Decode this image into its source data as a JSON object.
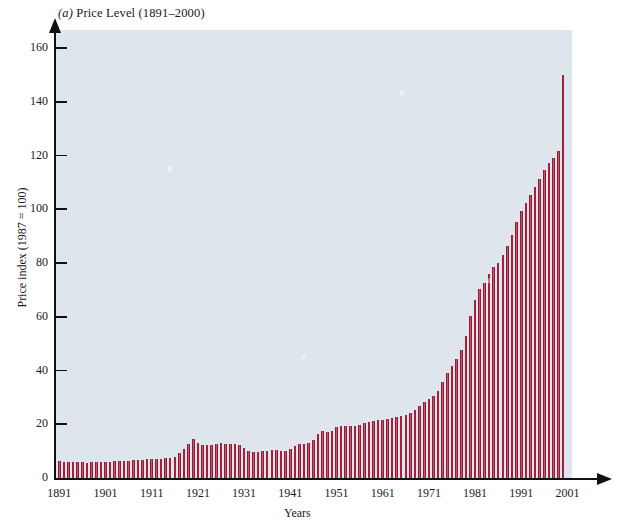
{
  "chart_data": {
    "type": "bar",
    "title": "(a) Price Level (1891–2000)",
    "title_prefix": "(a)",
    "title_rest": " Price Level (1891–2000)",
    "xlabel": "Years",
    "ylabel": "Price index (1987 = 100)",
    "ylim": [
      0,
      160
    ],
    "xlim": [
      1891,
      2001
    ],
    "y_ticks": [
      0,
      20,
      40,
      60,
      80,
      100,
      120,
      140,
      160
    ],
    "x_ticks": [
      1891,
      1901,
      1911,
      1921,
      1931,
      1941,
      1951,
      1961,
      1971,
      1981,
      1991,
      2001
    ],
    "grid": false,
    "legend": null,
    "bar_color": "#9c1b33",
    "bar_edge_color": "#7d1128",
    "plot_background": "#dee5ed",
    "axis_color": "#111111",
    "categories": [
      1891,
      1892,
      1893,
      1894,
      1895,
      1896,
      1897,
      1898,
      1899,
      1900,
      1901,
      1902,
      1903,
      1904,
      1905,
      1906,
      1907,
      1908,
      1909,
      1910,
      1911,
      1912,
      1913,
      1914,
      1915,
      1916,
      1917,
      1918,
      1919,
      1920,
      1921,
      1922,
      1923,
      1924,
      1925,
      1926,
      1927,
      1928,
      1929,
      1930,
      1931,
      1932,
      1933,
      1934,
      1935,
      1936,
      1937,
      1938,
      1939,
      1940,
      1941,
      1942,
      1943,
      1944,
      1945,
      1946,
      1947,
      1948,
      1949,
      1950,
      1951,
      1952,
      1953,
      1954,
      1955,
      1956,
      1957,
      1958,
      1959,
      1960,
      1961,
      1962,
      1963,
      1964,
      1965,
      1966,
      1967,
      1968,
      1969,
      1970,
      1971,
      1972,
      1973,
      1974,
      1975,
      1976,
      1977,
      1978,
      1979,
      1980,
      1981,
      1982,
      1983,
      1984,
      1985,
      1986,
      1987,
      1988,
      1989,
      1990,
      1991,
      1992,
      1993,
      1994,
      1995,
      1996,
      1997,
      1998,
      1999,
      2000
    ],
    "values": [
      6.2,
      6.1,
      6.1,
      5.9,
      5.8,
      5.8,
      5.7,
      5.8,
      5.8,
      5.9,
      6.0,
      6.1,
      6.3,
      6.3,
      6.3,
      6.4,
      6.7,
      6.6,
      6.6,
      6.9,
      6.9,
      7.1,
      7.2,
      7.3,
      7.4,
      7.9,
      9.3,
      10.9,
      12.6,
      14.6,
      13.0,
      12.2,
      12.4,
      12.4,
      12.7,
      12.9,
      12.6,
      12.5,
      12.5,
      12.2,
      11.1,
      10.0,
      9.5,
      9.8,
      10.0,
      10.1,
      10.5,
      10.3,
      10.1,
      10.2,
      10.7,
      11.8,
      12.6,
      12.8,
      13.1,
      14.2,
      16.2,
      17.5,
      17.3,
      17.5,
      18.9,
      19.3,
      19.4,
      19.5,
      19.5,
      19.7,
      20.4,
      20.9,
      21.1,
      21.5,
      21.7,
      22.0,
      22.3,
      22.6,
      22.9,
      23.6,
      24.3,
      25.3,
      26.7,
      28.3,
      29.5,
      30.5,
      32.4,
      35.9,
      39.2,
      41.5,
      44.2,
      47.5,
      52.9,
      60.1,
      66.3,
      70.4,
      72.6,
      75.8,
      78.4,
      79.9,
      82.8,
      86.2,
      90.3,
      95.2,
      99.3,
      102.3,
      105.4,
      108.1,
      111.2,
      114.5,
      117.2,
      119.0,
      121.6,
      150.0
    ]
  },
  "axes": {
    "y_tick_labels": [
      "0",
      "20",
      "40",
      "60",
      "80",
      "100",
      "120",
      "140",
      "160"
    ],
    "x_tick_labels": [
      "1891",
      "1901",
      "1911",
      "1921",
      "1931",
      "1941",
      "1951",
      "1961",
      "1971",
      "1981",
      "1991",
      "2001"
    ]
  }
}
